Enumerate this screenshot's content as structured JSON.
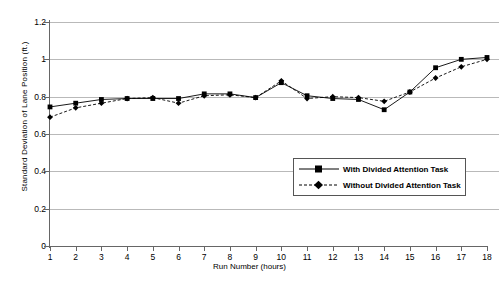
{
  "chart_data": {
    "type": "line",
    "title": "",
    "xlabel": "Run Number (hours)",
    "ylabel": "Standard Deviation of Lane Position (ft.)",
    "x": [
      1,
      2,
      3,
      4,
      5,
      6,
      7,
      8,
      9,
      10,
      11,
      12,
      13,
      14,
      15,
      16,
      17,
      18
    ],
    "xtick_labels": [
      "1",
      "2",
      "3",
      "4",
      "5",
      "6",
      "7",
      "8",
      "9",
      "10",
      "11",
      "12",
      "13",
      "14",
      "15",
      "16",
      "17",
      "18"
    ],
    "ytick_labels": [
      "0",
      "0.2",
      "0.4",
      "0.6",
      "0.8",
      "1",
      "1.2"
    ],
    "ytick_values": [
      0,
      0.2,
      0.4,
      0.6,
      0.8,
      1,
      1.2
    ],
    "xlim": [
      1,
      18
    ],
    "ylim": [
      0,
      1.2
    ],
    "grid": "horizontal",
    "legend_position": "inside-lower-right",
    "series": [
      {
        "name": "With Divided Attention Task",
        "marker": "square",
        "line_style": "solid",
        "color": "#000000",
        "values": [
          0.745,
          0.765,
          0.785,
          0.79,
          0.79,
          0.79,
          0.815,
          0.815,
          0.795,
          0.875,
          0.805,
          0.79,
          0.785,
          0.73,
          0.825,
          0.955,
          1.0,
          1.01
        ]
      },
      {
        "name": "Without Divided Attention Task",
        "marker": "diamond",
        "line_style": "dashed",
        "color": "#000000",
        "values": [
          0.69,
          0.74,
          0.765,
          0.79,
          0.795,
          0.765,
          0.805,
          0.81,
          0.795,
          0.885,
          0.79,
          0.8,
          0.795,
          0.775,
          0.825,
          0.9,
          0.96,
          1.0
        ]
      }
    ]
  },
  "legend": {
    "items": [
      {
        "label": "With Divided Attention Task"
      },
      {
        "label": "Without Divided Attention Task"
      }
    ]
  }
}
